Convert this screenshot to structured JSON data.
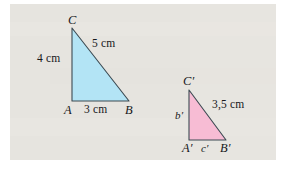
{
  "figure": {
    "background_color": "#e8e6e1",
    "frame_color": "#ffffff",
    "stroke_color": "#3c4a52",
    "text_color": "#16181a"
  },
  "triangle_1": {
    "name": "triangle-abc",
    "fill_color": "#b3e4f5",
    "vertices": {
      "A": {
        "label": "A",
        "x": 72,
        "y": 101
      },
      "B": {
        "label": "B",
        "x": 129,
        "y": 101
      },
      "C": {
        "label": "C",
        "x": 72,
        "y": 28
      }
    },
    "sides": {
      "hypotenuse": {
        "label": "5 cm",
        "value": 5,
        "unit": "cm"
      },
      "vertical": {
        "label": "4 cm",
        "value": 4,
        "unit": "cm"
      },
      "base": {
        "label": "3 cm",
        "value": 3,
        "unit": "cm"
      }
    }
  },
  "triangle_2": {
    "name": "triangle-a-prime-b-prime-c-prime",
    "fill_color": "#f7bcd4",
    "vertices": {
      "A_prime": {
        "label": "A′",
        "x": 189,
        "y": 140
      },
      "B_prime": {
        "label": "B′",
        "x": 226,
        "y": 140
      },
      "C_prime": {
        "label": "C′",
        "x": 189,
        "y": 90
      }
    },
    "sides": {
      "hypotenuse": {
        "label": "3,5 cm",
        "value": 3.5,
        "unit": "cm"
      },
      "vertical": {
        "label": "b′"
      },
      "base": {
        "label": "c′"
      }
    }
  }
}
